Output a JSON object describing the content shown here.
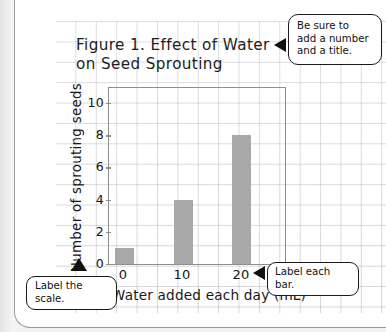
{
  "page": {
    "background_color": "#ffffff",
    "grid_color": "#b0b6bc",
    "margin_color": "#f2f2f2"
  },
  "figure": {
    "title": "Figure 1. Effect of Water\non Seed Sprouting"
  },
  "callouts": [
    {
      "id": "title-callout",
      "text": "Be sure to\nadd a number\nand a title.",
      "arrow": "left"
    },
    {
      "id": "bar-callout",
      "text": "Label each bar.",
      "arrow": "left"
    },
    {
      "id": "scale-callout",
      "text": "Label the scale.",
      "arrow": "up"
    }
  ],
  "chart_data": {
    "type": "bar",
    "title": "Figure 1. Effect of Water on Seed Sprouting",
    "categories": [
      "0",
      "10",
      "20"
    ],
    "values": [
      1,
      4,
      8
    ],
    "xlabel": "Water added each day (mL)",
    "ylabel": "Number of sprouting seeds",
    "ylim": [
      0,
      11
    ],
    "y_ticks": [
      0,
      2,
      4,
      6,
      8,
      10
    ],
    "y_tick_labels": [
      "0",
      "2",
      "4",
      "6",
      "8",
      "10"
    ],
    "x_tick_labels": [
      "0",
      "10",
      "20"
    ],
    "bar_color": "#a8a8a8",
    "axis_color": "#8d8d8d",
    "grid": false,
    "legend": false
  },
  "axes": {
    "y_title": "Number of sprouting seeds",
    "x_title": "Water added each day (mL)"
  }
}
